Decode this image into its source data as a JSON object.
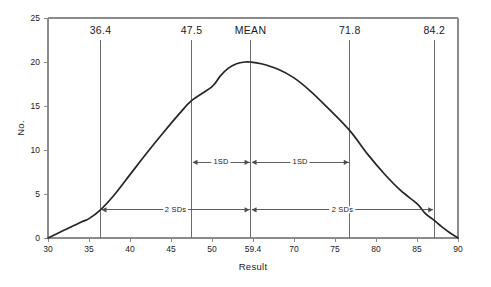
{
  "chart_data": {
    "type": "line",
    "title": "",
    "subtitle": "",
    "xlabel": "Result",
    "ylabel": "No.",
    "xlim": [
      30,
      90
    ],
    "ylim": [
      0,
      25
    ],
    "grid": false,
    "legend": null,
    "x_ticks": [
      {
        "value": 30,
        "label": "30"
      },
      {
        "value": 35,
        "label": "35"
      },
      {
        "value": 40,
        "label": "40"
      },
      {
        "value": 45,
        "label": "45"
      },
      {
        "value": 50,
        "label": "50"
      },
      {
        "value": 60,
        "label": "59.4"
      },
      {
        "value": 65,
        "label": "70"
      },
      {
        "value": 70,
        "label": "75"
      },
      {
        "value": 75,
        "label": "80"
      },
      {
        "value": 80,
        "label": "85"
      },
      {
        "value": 90,
        "label": "90"
      }
    ],
    "y_ticks": [
      {
        "value": 0,
        "label": "0"
      },
      {
        "value": 5,
        "label": "5"
      },
      {
        "value": 10,
        "label": "10"
      },
      {
        "value": 15,
        "label": "15"
      },
      {
        "value": 20,
        "label": "20"
      },
      {
        "value": 25,
        "label": "25"
      }
    ],
    "series": [
      {
        "name": "Normal distribution of results",
        "x": [
          30,
          32,
          34,
          35,
          36.4,
          38,
          40,
          42,
          44,
          46,
          47.5,
          50,
          52,
          54,
          56,
          58,
          59.4,
          61,
          63,
          65,
          67,
          69,
          71.8,
          74,
          76,
          78,
          80,
          82,
          84.2,
          86,
          88,
          90
        ],
        "y": [
          0.0,
          0.9,
          1.8,
          2.2,
          3.2,
          4.8,
          7.2,
          9.6,
          11.9,
          14.1,
          15.6,
          17.2,
          18.4,
          19.3,
          19.8,
          20.0,
          20.0,
          19.8,
          19.2,
          18.2,
          16.7,
          14.9,
          12.2,
          9.5,
          7.3,
          5.4,
          3.9,
          2.8,
          2.0,
          1.3,
          0.6,
          0.0
        ]
      }
    ],
    "markers": [
      {
        "id": "minus-2sd",
        "label": "36.4",
        "value": 36.4
      },
      {
        "id": "minus-1sd",
        "label": "47.5",
        "value": 47.5
      },
      {
        "id": "mean",
        "label": "MEAN",
        "value": 59.4
      },
      {
        "id": "plus-1sd",
        "label": "71.8",
        "value": 71.8
      },
      {
        "id": "plus-2sd",
        "label": "84.2",
        "value": 84.2
      }
    ],
    "annotations": [
      {
        "id": "sd-left-1",
        "label": "1SD",
        "from": 47.5,
        "to": 59.4,
        "y": 8.6
      },
      {
        "id": "sd-right-1",
        "label": "1SD",
        "from": 59.4,
        "to": 71.8,
        "y": 8.6
      },
      {
        "id": "sd-left-2",
        "label": "2 SDs",
        "from": 36.4,
        "to": 59.4,
        "y": 3.2
      },
      {
        "id": "sd-right-2",
        "label": "2 SDs",
        "from": 59.4,
        "to": 84.2,
        "y": 3.2
      }
    ],
    "colors": {
      "curve": "#262626",
      "axis": "#8c8c8c",
      "marker_line": "#6b6b6b",
      "annotation": "#4d4d4d",
      "background": "#ffffff"
    }
  }
}
